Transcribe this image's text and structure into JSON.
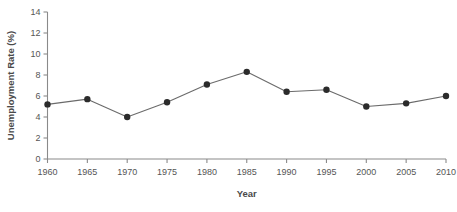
{
  "chart_data": {
    "type": "line",
    "title": "",
    "xlabel": "Year",
    "ylabel": "Unemployment Rate (%)",
    "x": [
      1960,
      1965,
      1970,
      1975,
      1980,
      1985,
      1990,
      1995,
      2000,
      2005,
      2010
    ],
    "values": [
      5.2,
      5.7,
      4.0,
      5.4,
      7.1,
      8.3,
      6.4,
      6.6,
      5.0,
      5.3,
      6.0
    ],
    "series": [
      {
        "name": "Unemployment Rate",
        "values": [
          5.2,
          5.7,
          4.0,
          5.4,
          7.1,
          8.3,
          6.4,
          6.6,
          5.0,
          5.3,
          6.0
        ]
      }
    ],
    "xtick_labels": [
      "1960",
      "1965",
      "1970",
      "1975",
      "1980",
      "1985",
      "1990",
      "1995",
      "2000",
      "2005",
      "2010"
    ],
    "ytick_labels": [
      "0",
      "2",
      "4",
      "6",
      "8",
      "10",
      "12",
      "14"
    ],
    "yticks": [
      0,
      2,
      4,
      6,
      8,
      10,
      12,
      14
    ],
    "xlim": [
      1960,
      2010
    ],
    "ylim": [
      0,
      14
    ],
    "grid": false,
    "legend": "none",
    "marker": "filled-circle",
    "line_color": "#6b6b6b",
    "marker_color": "#2b2b2b",
    "axis_color": "#8a8a8a"
  }
}
